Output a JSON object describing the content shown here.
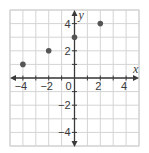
{
  "chart_data": {
    "type": "scatter",
    "title": "",
    "xlabel": "x",
    "ylabel": "y",
    "xlim": [
      -5,
      5
    ],
    "ylim": [
      -5,
      5
    ],
    "grid": true,
    "x_ticks": [
      -4,
      -2,
      0,
      2,
      4
    ],
    "y_ticks": [
      -4,
      -2,
      2,
      4
    ],
    "x_tick_labels": [
      "−4",
      "−2",
      "0",
      "2",
      "4"
    ],
    "y_tick_labels": [
      "−4",
      "−2",
      "2",
      "4"
    ],
    "points": [
      {
        "x": -4,
        "y": 1
      },
      {
        "x": -2,
        "y": 2
      },
      {
        "x": 0,
        "y": 3
      },
      {
        "x": 2,
        "y": 4
      }
    ],
    "colors": {
      "grid": "#d4d4d4",
      "axis": "#3a3a3a",
      "point": "#555555",
      "border": "#d0d0d0"
    }
  },
  "labels": {
    "x_axis": "x",
    "y_axis": "y",
    "origin": "0"
  }
}
